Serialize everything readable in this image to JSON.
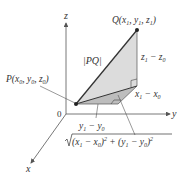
{
  "axes": {
    "x_label": "x",
    "y_label": "y",
    "z_label": "z",
    "origin_label": "0"
  },
  "points": {
    "P": {
      "label": "P(x",
      "sub": "0",
      "full": "P(x0, y0, z0)"
    },
    "Q": {
      "label": "Q(x",
      "sub": "1",
      "full": "Q(x1, y1, z1)"
    }
  },
  "labels": {
    "pq": "|PQ|",
    "z_diff": "z1 − z0",
    "x_diff": "x1 − x0",
    "y_diff": "y1 − y0",
    "horizontal_dist": "√(x1 − x0)² + (y1 − y0)²"
  },
  "colors": {
    "line": "#3a3a3a",
    "axis": "#555555",
    "fill_upper": "#d9d9d9",
    "fill_lower": "#bdbdbd"
  }
}
